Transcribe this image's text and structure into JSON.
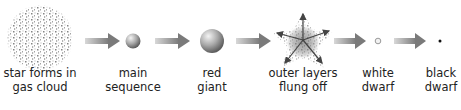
{
  "diagram": {
    "stages": [
      {
        "id": "gas-cloud",
        "line1": "star forms in",
        "line2": "gas cloud",
        "x": 40
      },
      {
        "id": "main-sequence",
        "line1": "main",
        "line2": "sequence",
        "x": 133
      },
      {
        "id": "red-giant",
        "line1": "red",
        "line2": "giant",
        "x": 212
      },
      {
        "id": "planetary-nebula",
        "line1": "outer layers",
        "line2": "flung off",
        "x": 303
      },
      {
        "id": "white-dwarf",
        "line1": "white",
        "line2": "dwarf",
        "x": 378
      },
      {
        "id": "black-dwarf",
        "line1": "black",
        "line2": "dwarf",
        "x": 441
      }
    ],
    "colors": {
      "arrow": "#8a8a8a",
      "sphere_light": "#e6e6e6",
      "sphere_dark": "#6e6e6e",
      "text": "#222222"
    }
  }
}
